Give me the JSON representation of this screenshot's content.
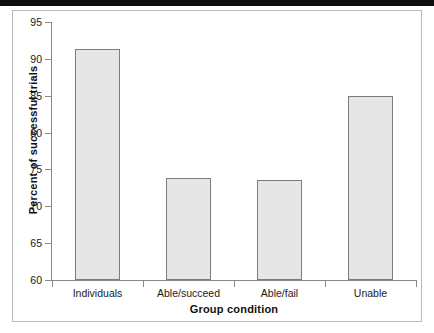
{
  "figure": {
    "background_color": "#ffffff",
    "frame_color": "#b9b9b9",
    "top_band_color": "#0d0d0d"
  },
  "chart_data": {
    "type": "bar",
    "title": "",
    "categories": [
      "Individuals",
      "Able/succeed",
      "Able/fail",
      "Unable"
    ],
    "values": [
      91.3,
      73.9,
      73.5,
      84.9
    ],
    "xlabel": "Group condition",
    "ylabel": "Percent of successful trials",
    "ylim": [
      60,
      95
    ],
    "yticks": [
      60,
      65,
      70,
      75,
      80,
      85,
      90,
      95
    ],
    "ytick_labels": [
      "60",
      "65",
      "70",
      "75",
      "80",
      "85",
      "90",
      "95"
    ],
    "grid": false,
    "legend": false,
    "bar_fill_color": "#e6e6e6",
    "bar_edge_color": "#7d7d7d",
    "axis_color": "#8a8a8a"
  }
}
